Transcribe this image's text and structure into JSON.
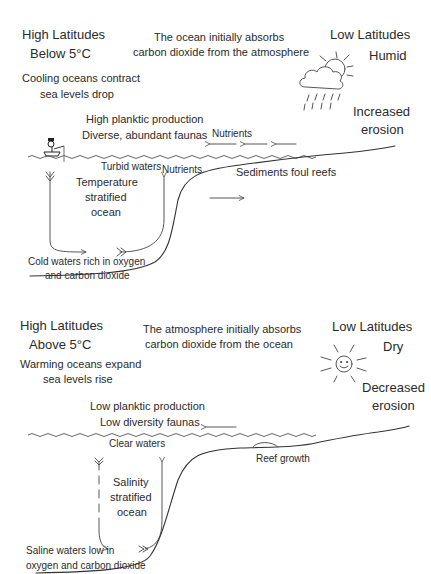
{
  "panels": [
    {
      "id": "cool",
      "high_latitudes": {
        "title": "High Latitudes",
        "subtitle": "Below 5°C"
      },
      "sea_level": [
        "Cooling oceans contract",
        "sea levels drop"
      ],
      "exchange": [
        "The ocean initially absorbs",
        "carbon dioxide from the atmosphere"
      ],
      "low_latitudes": {
        "title": "Low Latitudes",
        "climate": "Humid"
      },
      "erosion": [
        "Increased",
        "erosion"
      ],
      "productivity": [
        "High planktic production",
        "Diverse, abundant faunas"
      ],
      "surface_flow_label": "Nutrients",
      "water_clarity": "Turbid waters",
      "upwelling_label": "Nutrients",
      "stratification": [
        "Temperature",
        "stratified",
        "ocean"
      ],
      "shelf_note": "Sediments foul reefs",
      "deep_water": [
        "Cold waters rich in oxygen",
        "and carbon dioxide"
      ],
      "weather_icon": "cloud-sun-rain-icon",
      "boat_icon": "fisherman-boat-icon"
    },
    {
      "id": "warm",
      "high_latitudes": {
        "title": "High Latitudes",
        "subtitle": "Above 5°C"
      },
      "sea_level": [
        "Warming oceans expand",
        "sea levels rise"
      ],
      "exchange": [
        "The atmosphere initially absorbs",
        "carbon dioxide from the ocean"
      ],
      "low_latitudes": {
        "title": "Low Latitudes",
        "climate": "Dry"
      },
      "erosion": [
        "Decreased",
        "erosion"
      ],
      "productivity": [
        "Low planktic production",
        "Low diversity faunas"
      ],
      "water_clarity": "Clear waters",
      "stratification": [
        "Salinity",
        "stratified",
        "ocean"
      ],
      "shelf_note": "Reef growth",
      "deep_water": [
        "Saline waters low in",
        "oxygen and carbon dioxide"
      ],
      "weather_icon": "smiling-sun-icon"
    }
  ]
}
